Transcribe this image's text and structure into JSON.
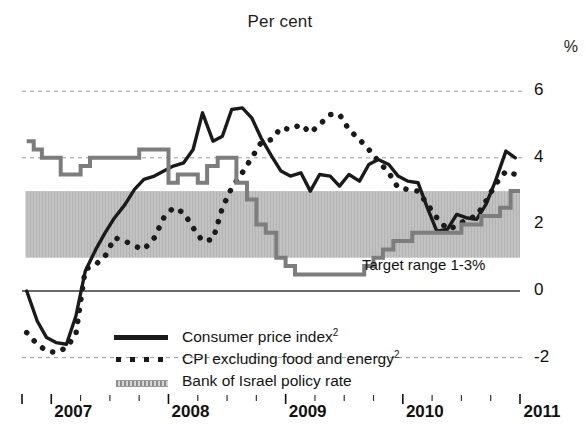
{
  "title": "Per cent",
  "unit_label": "%",
  "annotations": {
    "target_range": "Target range 1-3%"
  },
  "legend": {
    "position": "inside-bottom-left",
    "items": [
      {
        "label": "Consumer price index",
        "sup": "2",
        "marker": "solid-line",
        "color": "#1a1a1a"
      },
      {
        "label": "CPI excluding food and energy",
        "sup": "2",
        "marker": "dotted-line",
        "color": "#1a1a1a"
      },
      {
        "label": "Bank of Israel policy rate",
        "sup": "",
        "marker": "hatched-step-line",
        "color": "#8c8c8c"
      }
    ]
  },
  "chart_data": {
    "type": "line",
    "title": "Per cent",
    "xlabel": "",
    "ylabel": "%",
    "ylim": [
      -2.6,
      6.6
    ],
    "xlim": [
      2006.75,
      2011.0
    ],
    "yticks": [
      6,
      4,
      2,
      0,
      -2
    ],
    "ytick_labels": [
      "6",
      "4",
      "2",
      "0",
      "-2"
    ],
    "xticks": [
      2007,
      2008,
      2009,
      2010,
      2011
    ],
    "xtick_labels": [
      "2007",
      "2008",
      "2009",
      "2010",
      "2011"
    ],
    "grid": "dashed-horizontal-at-6-4-minus2",
    "zero_line": true,
    "bands": [
      {
        "name": "Target range 1-3%",
        "y0": 1,
        "y1": 3,
        "color": "#bfbfbf",
        "x0": 2006.78,
        "x1": 2011.0
      }
    ],
    "series": [
      {
        "name": "Consumer price index",
        "style": "solid",
        "color": "#1a1a1a",
        "width": 3.4,
        "x": [
          2006.79,
          2006.88,
          2006.96,
          2007.04,
          2007.13,
          2007.21,
          2007.29,
          2007.38,
          2007.46,
          2007.54,
          2007.63,
          2007.71,
          2007.79,
          2007.88,
          2007.96,
          2008.04,
          2008.13,
          2008.21,
          2008.29,
          2008.38,
          2008.46,
          2008.54,
          2008.63,
          2008.71,
          2008.79,
          2008.88,
          2008.96,
          2009.04,
          2009.13,
          2009.21,
          2009.29,
          2009.38,
          2009.46,
          2009.54,
          2009.63,
          2009.71,
          2009.79,
          2009.88,
          2009.96,
          2010.04,
          2010.13,
          2010.21,
          2010.29,
          2010.38,
          2010.46,
          2010.54,
          2010.63,
          2010.71,
          2010.79,
          2010.88,
          2010.96
        ],
        "y": [
          0.0,
          -0.9,
          -1.4,
          -1.55,
          -1.6,
          -0.75,
          0.6,
          1.25,
          1.75,
          2.2,
          2.6,
          3.05,
          3.35,
          3.45,
          3.6,
          3.75,
          3.85,
          4.25,
          5.35,
          4.5,
          4.65,
          5.45,
          5.5,
          5.2,
          4.6,
          4.05,
          3.6,
          3.45,
          3.55,
          3.0,
          3.5,
          3.45,
          3.15,
          3.5,
          3.3,
          3.8,
          3.95,
          3.8,
          3.45,
          3.3,
          3.25,
          2.5,
          1.8,
          1.85,
          2.3,
          2.2,
          2.15,
          2.6,
          3.3,
          4.2,
          4.0
        ]
      },
      {
        "name": "CPI excluding food and energy",
        "style": "dotted",
        "color": "#1a1a1a",
        "width": 5.5,
        "x": [
          2006.79,
          2006.88,
          2006.96,
          2007.04,
          2007.13,
          2007.21,
          2007.29,
          2007.38,
          2007.46,
          2007.54,
          2007.63,
          2007.71,
          2007.79,
          2007.88,
          2007.96,
          2008.04,
          2008.13,
          2008.21,
          2008.29,
          2008.38,
          2008.46,
          2008.54,
          2008.63,
          2008.71,
          2008.79,
          2008.88,
          2008.96,
          2009.04,
          2009.13,
          2009.21,
          2009.29,
          2009.38,
          2009.46,
          2009.54,
          2009.63,
          2009.71,
          2009.79,
          2009.88,
          2009.96,
          2010.04,
          2010.13,
          2010.21,
          2010.29,
          2010.38,
          2010.46,
          2010.54,
          2010.63,
          2010.71,
          2010.79,
          2010.88,
          2010.96
        ],
        "y": [
          -1.25,
          -1.6,
          -1.8,
          -1.85,
          -1.7,
          -1.3,
          0.65,
          0.8,
          1.05,
          1.6,
          1.5,
          1.35,
          1.25,
          1.6,
          2.2,
          2.5,
          2.35,
          1.9,
          1.5,
          1.55,
          2.5,
          3.1,
          3.55,
          4.0,
          4.45,
          4.55,
          4.9,
          4.85,
          5.0,
          4.75,
          5.0,
          5.3,
          5.3,
          4.85,
          4.55,
          4.25,
          3.9,
          3.55,
          3.1,
          3.05,
          3.0,
          2.6,
          2.2,
          1.85,
          1.95,
          2.15,
          2.25,
          2.7,
          3.2,
          3.6,
          3.5
        ]
      },
      {
        "name": "Bank of Israel policy rate",
        "style": "step",
        "color": "#8c8c8c",
        "width": 4,
        "x": [
          2006.79,
          2006.85,
          2006.92,
          2007.0,
          2007.08,
          2007.17,
          2007.25,
          2007.33,
          2007.42,
          2007.5,
          2007.75,
          2007.92,
          2008.0,
          2008.08,
          2008.17,
          2008.25,
          2008.33,
          2008.42,
          2008.5,
          2008.58,
          2008.67,
          2008.75,
          2008.83,
          2008.92,
          2009.0,
          2009.08,
          2009.17,
          2009.25,
          2009.5,
          2009.67,
          2009.75,
          2009.83,
          2009.92,
          2010.0,
          2010.08,
          2010.17,
          2010.25,
          2010.5,
          2010.58,
          2010.67,
          2010.75,
          2010.83,
          2010.92,
          2011.0
        ],
        "y": [
          4.5,
          4.25,
          4.0,
          4.0,
          3.5,
          3.5,
          3.75,
          4.0,
          4.0,
          4.0,
          4.25,
          4.25,
          3.25,
          3.5,
          3.5,
          3.25,
          3.75,
          4.0,
          4.0,
          3.25,
          2.75,
          2.0,
          1.75,
          1.0,
          0.75,
          0.5,
          0.5,
          0.5,
          0.5,
          0.75,
          1.0,
          1.25,
          1.5,
          1.5,
          1.75,
          1.75,
          1.75,
          2.0,
          2.0,
          2.25,
          2.25,
          2.5,
          3.0,
          3.0
        ]
      }
    ]
  }
}
